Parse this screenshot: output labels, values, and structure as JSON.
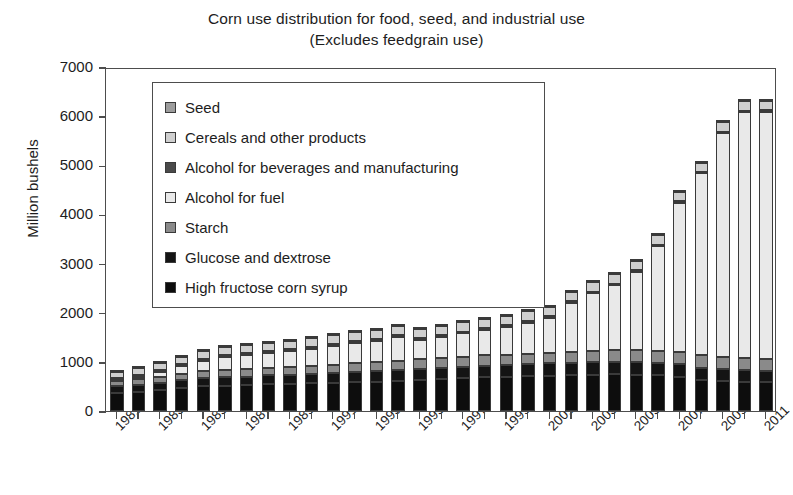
{
  "chart_data": {
    "type": "bar",
    "stacked": true,
    "title": "Corn use distribution for food, seed, and industrial use",
    "subtitle": "(Excludes feedgrain use)",
    "xlabel": "",
    "ylabel": "Million bushels",
    "ylim": [
      0,
      7000
    ],
    "yticks": [
      0,
      1000,
      2000,
      3000,
      4000,
      5000,
      6000,
      7000
    ],
    "grid": false,
    "legend_position": "upper-left-inside",
    "x": [
      1981,
      1982,
      1983,
      1984,
      1985,
      1986,
      1987,
      1988,
      1989,
      1990,
      1991,
      1992,
      1993,
      1994,
      1995,
      1996,
      1997,
      1998,
      1999,
      2000,
      2001,
      2002,
      2003,
      2004,
      2005,
      2006,
      2007,
      2008,
      2009,
      2010,
      2011
    ],
    "xtick_labels": [
      "1981",
      "1983",
      "1985",
      "1987",
      "1989",
      "1991",
      "1993",
      "1995",
      "1997",
      "1999",
      "2001",
      "2003",
      "2005",
      "2007",
      "2009",
      "2011"
    ],
    "series": [
      {
        "name": "High fructose corn syrup",
        "color": "#0d0d0d",
        "values": [
          360,
          390,
          430,
          470,
          500,
          510,
          520,
          540,
          550,
          560,
          570,
          590,
          600,
          620,
          640,
          650,
          670,
          690,
          700,
          710,
          720,
          730,
          740,
          745,
          740,
          730,
          700,
          640,
          610,
          595,
          585
        ]
      },
      {
        "name": "Glucose and dextrose",
        "color": "#141414",
        "values": [
          140,
          145,
          150,
          160,
          170,
          175,
          180,
          185,
          190,
          195,
          200,
          205,
          210,
          215,
          220,
          225,
          230,
          235,
          240,
          245,
          248,
          250,
          252,
          255,
          255,
          255,
          250,
          245,
          240,
          238,
          236
        ]
      },
      {
        "name": "Starch",
        "color": "#8a8a8a",
        "values": [
          110,
          115,
          120,
          130,
          140,
          145,
          150,
          155,
          160,
          165,
          170,
          175,
          180,
          185,
          190,
          195,
          200,
          205,
          210,
          215,
          220,
          225,
          230,
          235,
          240,
          245,
          250,
          250,
          245,
          245,
          245
        ]
      },
      {
        "name": "Alcohol for fuel",
        "color": "#e9e9e9",
        "values": [
          20,
          45,
          90,
          155,
          210,
          270,
          290,
          300,
          320,
          340,
          380,
          420,
          430,
          480,
          400,
          430,
          480,
          520,
          560,
          630,
          710,
          1000,
          1170,
          1320,
          1600,
          2120,
          3040,
          3700,
          4560,
          5000,
          5020
        ]
      },
      {
        "name": "Alcohol for beverages and manufacturing",
        "color": "#4a4a4a",
        "values": [
          38,
          38,
          38,
          38,
          38,
          38,
          38,
          38,
          38,
          38,
          38,
          38,
          38,
          38,
          38,
          38,
          38,
          38,
          38,
          38,
          38,
          36,
          35,
          35,
          34,
          33,
          32,
          32,
          31,
          31,
          31
        ]
      },
      {
        "name": "Cereals and other products",
        "color": "#cfcfcf",
        "values": [
          135,
          140,
          145,
          150,
          155,
          160,
          165,
          170,
          175,
          180,
          185,
          190,
          190,
          190,
          190,
          190,
          190,
          190,
          190,
          190,
          190,
          190,
          190,
          190,
          190,
          190,
          190,
          190,
          190,
          190,
          190
        ]
      },
      {
        "name": "Seed",
        "color": "#9c9c9c",
        "values": [
          20,
          20,
          21,
          21,
          22,
          20,
          19,
          20,
          21,
          22,
          21,
          21,
          20,
          22,
          21,
          23,
          22,
          22,
          21,
          21,
          21,
          21,
          21,
          22,
          22,
          22,
          24,
          23,
          22,
          23,
          23
        ]
      }
    ],
    "totals": [
      823,
      893,
      994,
      1124,
      1235,
      1318,
      1362,
      1408,
      1454,
      1500,
      1564,
      1639,
      1668,
      1750,
      1699,
      1761,
      1830,
      1900,
      1959,
      2052,
      2147,
      2452,
      2638,
      2802,
      3081,
      3595,
      4486,
      5080,
      5898,
      6322,
      6330
    ]
  },
  "legend": {
    "items": [
      {
        "label": "Seed",
        "color": "#9c9c9c"
      },
      {
        "label": "Cereals and other products",
        "color": "#cfcfcf"
      },
      {
        "label": "Alcohol for beverages and manufacturing",
        "color": "#4a4a4a"
      },
      {
        "label": "Alcohol for fuel",
        "color": "#e9e9e9"
      },
      {
        "label": "Starch",
        "color": "#8a8a8a"
      },
      {
        "label": "Glucose and dextrose",
        "color": "#141414"
      },
      {
        "label": "High fructose corn syrup",
        "color": "#0d0d0d"
      }
    ]
  },
  "axes": {
    "y_title": "Million bushels",
    "y_tick_labels": [
      "0",
      "1000",
      "2000",
      "3000",
      "4000",
      "5000",
      "6000",
      "7000"
    ]
  }
}
